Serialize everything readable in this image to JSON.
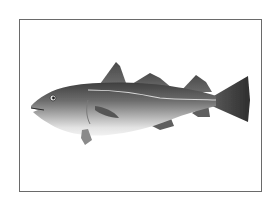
{
  "image": {
    "subject": "Atlantic cod fish illustration",
    "style": "grayscale photograph in rectangular frame",
    "colors": {
      "background": "#ffffff",
      "frame_border": "#6a6a6a",
      "fish_dark": "#3d3d3d",
      "fish_mid": "#8a8a8a",
      "fish_belly": "#e8e8e8",
      "lateral_line": "#d8d8d8"
    }
  }
}
